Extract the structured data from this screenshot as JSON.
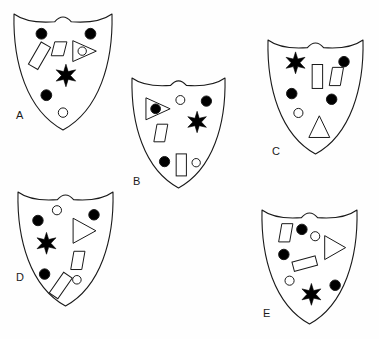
{
  "figure": {
    "title": "",
    "background_color": "#fefefe",
    "stroke_color": "#1a1a1a",
    "fill_color": "#000000",
    "empty_fill": "#ffffff",
    "width": 379,
    "height": 339
  },
  "shields": [
    {
      "id": "A",
      "label": "A",
      "label_x": 16,
      "label_y": 119,
      "x": 14,
      "y": 14,
      "w": 98,
      "h": 116,
      "symbols": [
        {
          "name": "filled-circle",
          "type": "circle",
          "cx": 0.28,
          "cy": 0.17,
          "r": 0.055,
          "filled": true
        },
        {
          "name": "filled-circle",
          "type": "circle",
          "cx": 0.78,
          "cy": 0.17,
          "r": 0.055,
          "filled": true
        },
        {
          "name": "rhombus",
          "type": "rhombus",
          "cx": 0.46,
          "cy": 0.3,
          "w": 0.16,
          "h": 0.12,
          "filled": false
        },
        {
          "name": "tilted-rectangle",
          "type": "rect",
          "cx": 0.26,
          "cy": 0.36,
          "w": 0.11,
          "h": 0.22,
          "rot": 30,
          "filled": false
        },
        {
          "name": "triangle-with-circle",
          "type": "triangle-right-ring",
          "cx": 0.72,
          "cy": 0.32,
          "w": 0.24,
          "h": 0.18,
          "filled": false
        },
        {
          "name": "six-point-star",
          "type": "star6",
          "cx": 0.53,
          "cy": 0.53,
          "r": 0.115,
          "filled": true
        },
        {
          "name": "filled-circle",
          "type": "circle",
          "cx": 0.33,
          "cy": 0.7,
          "r": 0.055,
          "filled": true
        },
        {
          "name": "open-circle",
          "type": "circle",
          "cx": 0.5,
          "cy": 0.85,
          "r": 0.048,
          "filled": false
        }
      ]
    },
    {
      "id": "B",
      "label": "B",
      "label_x": 133,
      "label_y": 185,
      "x": 132,
      "y": 78,
      "w": 93,
      "h": 110,
      "symbols": [
        {
          "name": "triangle-with-dot",
          "type": "triangle-right-dot",
          "cx": 0.28,
          "cy": 0.28,
          "w": 0.26,
          "h": 0.2,
          "filled": false
        },
        {
          "name": "open-circle",
          "type": "circle",
          "cx": 0.52,
          "cy": 0.2,
          "r": 0.048,
          "filled": false
        },
        {
          "name": "filled-circle",
          "type": "circle",
          "cx": 0.8,
          "cy": 0.21,
          "r": 0.055,
          "filled": true
        },
        {
          "name": "six-point-star",
          "type": "star6",
          "cx": 0.7,
          "cy": 0.4,
          "r": 0.115,
          "filled": true
        },
        {
          "name": "rhombus",
          "type": "rhombus",
          "cx": 0.31,
          "cy": 0.5,
          "w": 0.15,
          "h": 0.16,
          "filled": false
        },
        {
          "name": "filled-circle",
          "type": "circle",
          "cx": 0.35,
          "cy": 0.76,
          "r": 0.055,
          "filled": true
        },
        {
          "name": "upright-rectangle",
          "type": "rect",
          "cx": 0.53,
          "cy": 0.79,
          "w": 0.11,
          "h": 0.2,
          "rot": 0,
          "filled": false
        },
        {
          "name": "open-circle",
          "type": "circle",
          "cx": 0.69,
          "cy": 0.77,
          "r": 0.045,
          "filled": false
        }
      ]
    },
    {
      "id": "C",
      "label": "C",
      "label_x": 272,
      "label_y": 155,
      "x": 268,
      "y": 40,
      "w": 95,
      "h": 114,
      "symbols": [
        {
          "name": "six-point-star",
          "type": "star6",
          "cx": 0.29,
          "cy": 0.2,
          "r": 0.115,
          "filled": true
        },
        {
          "name": "filled-circle",
          "type": "circle",
          "cx": 0.8,
          "cy": 0.19,
          "r": 0.055,
          "filled": true
        },
        {
          "name": "upright-rectangle",
          "type": "rect",
          "cx": 0.52,
          "cy": 0.32,
          "w": 0.11,
          "h": 0.21,
          "rot": 0,
          "filled": false
        },
        {
          "name": "rhombus",
          "type": "rhombus",
          "cx": 0.72,
          "cy": 0.32,
          "w": 0.15,
          "h": 0.16,
          "filled": false
        },
        {
          "name": "filled-circle",
          "type": "circle",
          "cx": 0.25,
          "cy": 0.47,
          "r": 0.055,
          "filled": true
        },
        {
          "name": "filled-circle",
          "type": "circle",
          "cx": 0.67,
          "cy": 0.52,
          "r": 0.055,
          "filled": true
        },
        {
          "name": "open-circle",
          "type": "circle",
          "cx": 0.32,
          "cy": 0.64,
          "r": 0.048,
          "filled": false
        },
        {
          "name": "triangle-up",
          "type": "triangle-up",
          "cx": 0.54,
          "cy": 0.76,
          "w": 0.22,
          "h": 0.19,
          "filled": false
        }
      ]
    },
    {
      "id": "D",
      "label": "D",
      "label_x": 16,
      "label_y": 281,
      "x": 18,
      "y": 192,
      "w": 95,
      "h": 114,
      "symbols": [
        {
          "name": "open-circle",
          "type": "circle",
          "cx": 0.41,
          "cy": 0.16,
          "r": 0.048,
          "filled": false
        },
        {
          "name": "filled-circle",
          "type": "circle",
          "cx": 0.21,
          "cy": 0.25,
          "r": 0.055,
          "filled": true
        },
        {
          "name": "filled-circle",
          "type": "circle",
          "cx": 0.8,
          "cy": 0.2,
          "r": 0.055,
          "filled": true
        },
        {
          "name": "triangle-right",
          "type": "triangle-right",
          "cx": 0.7,
          "cy": 0.34,
          "w": 0.24,
          "h": 0.22,
          "filled": false
        },
        {
          "name": "six-point-star",
          "type": "star6",
          "cx": 0.3,
          "cy": 0.45,
          "r": 0.115,
          "filled": true
        },
        {
          "name": "rhombus",
          "type": "rhombus",
          "cx": 0.63,
          "cy": 0.6,
          "w": 0.15,
          "h": 0.16,
          "filled": false
        },
        {
          "name": "filled-circle",
          "type": "circle",
          "cx": 0.28,
          "cy": 0.72,
          "r": 0.055,
          "filled": true
        },
        {
          "name": "open-circle",
          "type": "circle",
          "cx": 0.62,
          "cy": 0.77,
          "r": 0.045,
          "filled": false
        },
        {
          "name": "tilted-rectangle",
          "type": "rect",
          "cx": 0.45,
          "cy": 0.82,
          "w": 0.11,
          "h": 0.22,
          "rot": 35,
          "filled": false
        }
      ]
    },
    {
      "id": "E",
      "label": "E",
      "label_x": 263,
      "label_y": 317,
      "x": 262,
      "y": 210,
      "w": 95,
      "h": 114,
      "symbols": [
        {
          "name": "rhombus",
          "type": "rhombus",
          "cx": 0.25,
          "cy": 0.2,
          "w": 0.15,
          "h": 0.16,
          "filled": false
        },
        {
          "name": "filled-circle",
          "type": "circle",
          "cx": 0.42,
          "cy": 0.17,
          "r": 0.055,
          "filled": true
        },
        {
          "name": "open-circle",
          "type": "circle",
          "cx": 0.56,
          "cy": 0.23,
          "r": 0.048,
          "filled": false
        },
        {
          "name": "triangle-right",
          "type": "triangle-right",
          "cx": 0.77,
          "cy": 0.33,
          "w": 0.22,
          "h": 0.21,
          "filled": false
        },
        {
          "name": "filled-circle",
          "type": "circle",
          "cx": 0.23,
          "cy": 0.39,
          "r": 0.055,
          "filled": true
        },
        {
          "name": "tilted-rectangle",
          "type": "rect",
          "cx": 0.45,
          "cy": 0.47,
          "w": 0.1,
          "h": 0.21,
          "rot": 75,
          "filled": false
        },
        {
          "name": "open-circle",
          "type": "circle",
          "cx": 0.29,
          "cy": 0.62,
          "r": 0.048,
          "filled": false
        },
        {
          "name": "six-point-star",
          "type": "star6",
          "cx": 0.52,
          "cy": 0.74,
          "r": 0.115,
          "filled": true
        },
        {
          "name": "filled-circle",
          "type": "circle",
          "cx": 0.77,
          "cy": 0.66,
          "r": 0.055,
          "filled": true
        }
      ]
    }
  ]
}
